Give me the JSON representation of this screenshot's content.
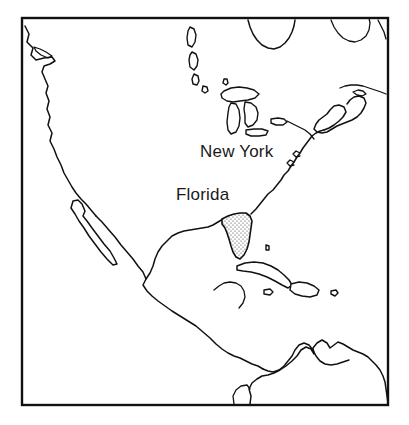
{
  "figure": {
    "kind": "outline-map",
    "region": "North America, Central America, Caribbean and northern South America",
    "background_color": "#ffffff",
    "line_color": "#111111",
    "width": 409,
    "height": 425
  },
  "frame": {
    "name": "map-border",
    "visible": true,
    "x": 22,
    "y": 18,
    "width": 366,
    "height": 387,
    "stroke_color": "#111111"
  },
  "labels": [
    {
      "id": "new-york",
      "text": "New York",
      "x": 200,
      "y": 157,
      "font_size": 17
    },
    {
      "id": "florida",
      "text": "Florida",
      "x": 176,
      "y": 200,
      "font_size": 17
    }
  ],
  "highlighted_regions": [
    {
      "id": "florida-peninsula",
      "name": "Florida",
      "fill_style": "stipple-dots",
      "fill_color": "#ffffff",
      "dot_color": "#333333"
    }
  ],
  "features": {
    "mainland": "North America mainland coastline from Pacific Northwest through Mexico, Central America to northern South America, including Gulf of Mexico and Atlantic seaboard",
    "peninsulas": [
      "Baja California",
      "Florida",
      "Yucatan",
      "Nova Scotia"
    ],
    "bays": [
      "Hudson Bay",
      "Gulf of Mexico",
      "Gulf of California",
      "Gulf of St. Lawrence"
    ],
    "great_lakes": [
      "Lake Superior",
      "Lake Michigan",
      "Lake Huron",
      "Lake Erie",
      "Lake Ontario"
    ],
    "islands": [
      "Cuba",
      "Hispaniola",
      "Jamaica",
      "Puerto Rico",
      "Newfoundland",
      "Baffin Island",
      "Vancouver Island"
    ]
  }
}
